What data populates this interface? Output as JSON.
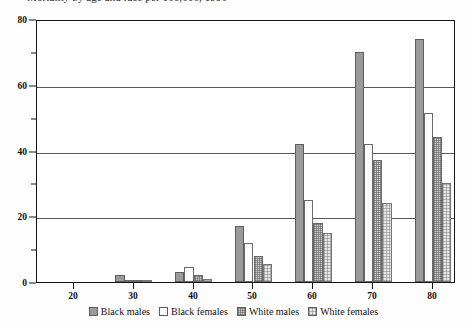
{
  "title": "Mortality by age and race per 100,000, 1990",
  "chart_data": {
    "type": "bar",
    "title": "Mortality by age and race per 100,000, 1990",
    "xlabel": "",
    "ylabel": "",
    "categories": [
      "20",
      "30",
      "40",
      "50",
      "60",
      "70",
      "80"
    ],
    "series": [
      {
        "name": "Black males",
        "color": "#9a9a9a",
        "pattern": "solid",
        "values": [
          0,
          2,
          3,
          17,
          42,
          70,
          74
        ]
      },
      {
        "name": "Black females",
        "color": "#fbfbfb",
        "pattern": "empty",
        "values": [
          0,
          0.5,
          4.5,
          12,
          25,
          42,
          51.5
        ]
      },
      {
        "name": "White males",
        "color": "#d2d2d2",
        "pattern": "dense-dots",
        "values": [
          0,
          0.3,
          2,
          8,
          18,
          37,
          44
        ]
      },
      {
        "name": "White females",
        "color": "#e6e6e6",
        "pattern": "light-dots",
        "values": [
          0,
          0.2,
          1,
          5.5,
          15,
          24,
          30
        ]
      }
    ],
    "ylim": [
      0,
      80
    ],
    "yticks": [
      0,
      20,
      40,
      60,
      80
    ],
    "yticks_minor": [
      10,
      30,
      50,
      70
    ],
    "xticks": [
      "20",
      "30",
      "40",
      "50",
      "60",
      "70",
      "80"
    ],
    "grid": true,
    "legend_position": "bottom"
  },
  "legend": {
    "items": [
      {
        "label": "Black males"
      },
      {
        "label": "Black females"
      },
      {
        "label": "White males"
      },
      {
        "label": "White females"
      }
    ]
  }
}
